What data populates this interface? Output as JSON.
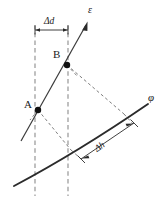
{
  "figure": {
    "title": "",
    "background_color": "#ffffff",
    "width": 166,
    "height": 198,
    "colors": {
      "curve": "#2b2b2b",
      "line": "#3a3a3a",
      "dashed_vertical": "#8c8c8c",
      "dashed_diagonal": "#6f6f6f",
      "dimension": "#2b2b2b",
      "point_marker": "#111111",
      "label_text": "#1a1a1a"
    },
    "labels": {
      "epsilon": "ε",
      "phi": "φ",
      "point_a": "A",
      "point_b": "B",
      "delta_d": "Δd",
      "delta_h": "Δh"
    },
    "points": [
      {
        "name": "A",
        "label": "A",
        "x": 38,
        "y": 110
      },
      {
        "name": "B",
        "label": "B",
        "x": 67,
        "y": 65
      }
    ],
    "vertical_guides": [
      {
        "name": "guide-left",
        "x": 35,
        "y1": 25,
        "y2": 196
      },
      {
        "name": "guide-right",
        "x": 68,
        "y1": 25,
        "y2": 196
      }
    ],
    "epsilon_line": {
      "x1": 21,
      "y1": 141,
      "x2": 87,
      "y2": 23,
      "arrow": true,
      "label": "ε",
      "label_x": 93,
      "label_y": 14
    },
    "phi_curve": {
      "label": "φ",
      "label_x": 150,
      "label_y": 98,
      "start": {
        "x": 14,
        "y": 186
      },
      "control": {
        "x": 78,
        "y": 152
      },
      "end": {
        "x": 148,
        "y": 104
      }
    },
    "delta_d_dimension": {
      "label": "Δd",
      "x1": 35,
      "x2": 68,
      "y": 30,
      "label_x": 51,
      "label_y": 24
    },
    "delta_h_dimension": {
      "label": "Δh",
      "x1": 81,
      "y1": 159,
      "x2": 134,
      "y2": 123,
      "label_x": 104,
      "label_y": 147
    },
    "dashed_connectors": [
      {
        "name": "a-to-curve",
        "x1": 38,
        "y1": 110,
        "x2": 70,
        "y2": 149
      },
      {
        "name": "b-to-curve",
        "x1": 67,
        "y1": 65,
        "x2": 122,
        "y2": 112
      },
      {
        "name": "a-to-guide",
        "x1": 38,
        "y1": 110,
        "x2": 68,
        "y2": 148
      },
      {
        "name": "b-short-right",
        "x1": 67,
        "y1": 65,
        "x2": 78,
        "y2": 76
      }
    ]
  }
}
